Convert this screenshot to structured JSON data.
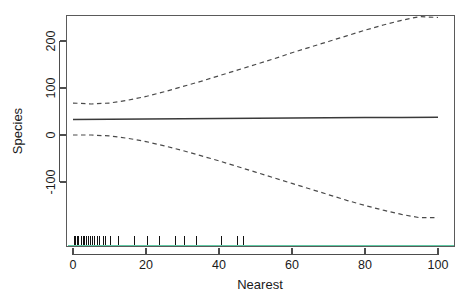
{
  "chart_data": {
    "type": "line",
    "title": "",
    "xlabel": "Nearest",
    "ylabel": "Species",
    "xlim": [
      -3,
      103
    ],
    "ylim": [
      -195,
      268
    ],
    "grid": false,
    "legend": null,
    "x_ticks": [
      0,
      20,
      40,
      60,
      80,
      100
    ],
    "x_tick_labels": [
      "0",
      "20",
      "40",
      "60",
      "80",
      "100"
    ],
    "y_ticks": [
      -100,
      0,
      100,
      200
    ],
    "y_tick_labels": [
      "-100",
      "0",
      "100",
      "200"
    ],
    "series": [
      {
        "name": "fit",
        "style": "solid",
        "color": "#3a3a3a",
        "x": [
          0,
          10,
          20,
          30,
          40,
          50,
          60,
          70,
          80,
          90,
          100
        ],
        "values": [
          33,
          33.5,
          34,
          34.5,
          35,
          35.5,
          36,
          36.5,
          37,
          37.5,
          38
        ]
      },
      {
        "name": "upper-confidence-band",
        "style": "dashed",
        "color": "#4a4a4a",
        "x": [
          0,
          5,
          10,
          15,
          20,
          25,
          30,
          35,
          40,
          45,
          50,
          55,
          60,
          65,
          70,
          75,
          80,
          85,
          90,
          95,
          100
        ],
        "values": [
          68,
          66,
          68,
          74,
          82,
          92,
          103,
          114,
          126,
          138,
          150,
          162,
          175,
          187,
          199,
          211,
          223,
          234,
          244,
          252,
          250
        ]
      },
      {
        "name": "lower-confidence-band",
        "style": "dashed",
        "color": "#4a4a4a",
        "x": [
          0,
          5,
          10,
          15,
          20,
          25,
          30,
          35,
          40,
          45,
          50,
          55,
          60,
          65,
          70,
          75,
          80,
          85,
          90,
          95,
          100
        ],
        "values": [
          0,
          0,
          -2,
          -7,
          -14,
          -23,
          -33,
          -44,
          -55,
          -67,
          -79,
          -91,
          -103,
          -115,
          -127,
          -139,
          -150,
          -160,
          -169,
          -176,
          -176
        ]
      }
    ],
    "rug": {
      "name": "rug-marks",
      "color": "#111111",
      "baseline_color": "#5fc9a4",
      "values": [
        0.4,
        0.8,
        1.2,
        1.6,
        2.2,
        2.8,
        3.2,
        3.8,
        4.3,
        4.9,
        5.4,
        6.0,
        6.6,
        7.2,
        8.4,
        9.0,
        10.2,
        12.6,
        16.8,
        20.4,
        23.6,
        28.2,
        30.5,
        33.8,
        40.6,
        45.2,
        46.8
      ]
    }
  }
}
